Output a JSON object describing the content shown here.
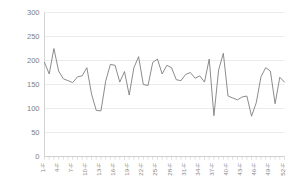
{
  "chart_data": {
    "type": "line",
    "title": "",
    "subtitle": "",
    "xlabel": "",
    "ylabel": "",
    "ylim": [
      0,
      300
    ],
    "ytick_values": [
      0,
      50,
      100,
      150,
      200,
      250,
      300
    ],
    "ytick_labels": [
      "0",
      "50",
      "100",
      "150",
      "200",
      "250",
      "300"
    ],
    "grid": true,
    "grid_axis": "y",
    "legend": false,
    "legend_position": "none",
    "line_color": "#7f7f7f",
    "background_color": "#ffffff",
    "gridline_color": "#e2e2e2",
    "axis_color": "#c9c9c9",
    "xtick_label_rotation": -90,
    "xtick_label_interval": 3,
    "categories": [
      "1-F",
      "2-F",
      "3-F",
      "4-F",
      "5-F",
      "6-F",
      "7-F",
      "8-F",
      "9-F",
      "10-F",
      "11-F",
      "12-F",
      "13-F",
      "14-F",
      "15-F",
      "16-F",
      "17-F",
      "18-F",
      "19-F",
      "20-F",
      "21-F",
      "22-F",
      "23-F",
      "24-F",
      "25-F",
      "26-F",
      "27-F",
      "28-F",
      "29-F",
      "30-F",
      "31-F",
      "32-F",
      "33-F",
      "34-F",
      "35-F",
      "36-F",
      "37-F",
      "38-F",
      "39-F",
      "40-F",
      "41-F",
      "42-F",
      "43-F",
      "44-F",
      "45-F",
      "46-F",
      "47-F",
      "48-F",
      "49-F",
      "50-F",
      "51-F",
      "52-F"
    ],
    "xtick_labels_shown": [
      "1-F",
      "4-F",
      "7-F",
      "10-F",
      "13-F",
      "16-F",
      "19-F",
      "22-F",
      "25-F",
      "28-F",
      "31-F",
      "34-F",
      "37-F",
      "40-F",
      "43-F",
      "46-F",
      "49-F",
      "52-F"
    ],
    "values": [
      196,
      172,
      225,
      178,
      162,
      158,
      154,
      166,
      168,
      185,
      130,
      96,
      95,
      157,
      192,
      190,
      155,
      177,
      128,
      185,
      208,
      150,
      148,
      196,
      203,
      172,
      190,
      185,
      160,
      158,
      171,
      175,
      163,
      168,
      155,
      203,
      85,
      180,
      215,
      126,
      122,
      118,
      124,
      126,
      84,
      112,
      166,
      185,
      178,
      110,
      165,
      155
    ],
    "series": [
      {
        "name": "series-1",
        "color": "#7f7f7f",
        "values": [
          196,
          172,
          225,
          178,
          162,
          158,
          154,
          166,
          168,
          185,
          130,
          96,
          95,
          157,
          192,
          190,
          155,
          177,
          128,
          185,
          208,
          150,
          148,
          196,
          203,
          172,
          190,
          185,
          160,
          158,
          171,
          175,
          163,
          168,
          155,
          203,
          85,
          180,
          215,
          126,
          122,
          118,
          124,
          126,
          84,
          112,
          166,
          185,
          178,
          110,
          165,
          155
        ]
      }
    ],
    "annotations": []
  }
}
